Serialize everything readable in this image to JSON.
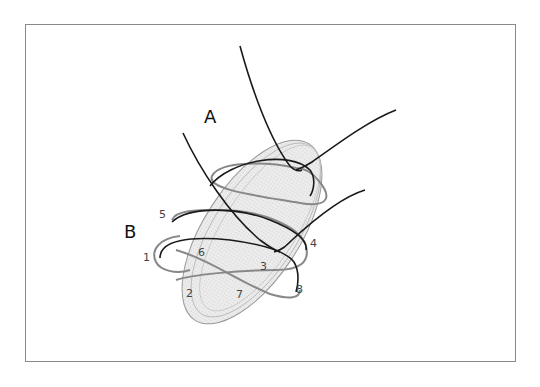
{
  "diagram": {
    "labels": {
      "A": "A",
      "B": "B"
    },
    "points": [
      {
        "id": "1",
        "label": "1"
      },
      {
        "id": "2",
        "label": "2"
      },
      {
        "id": "3",
        "label": "3"
      },
      {
        "id": "4",
        "label": "4"
      },
      {
        "id": "5",
        "label": "5"
      },
      {
        "id": "6",
        "label": "6"
      },
      {
        "id": "7",
        "label": "7"
      },
      {
        "id": "8",
        "label": "8"
      }
    ],
    "colors": {
      "frame": "#8a8a8a",
      "ellipse_fill": "#e6e6e6",
      "thread_dark": "#1a1a1a",
      "thread_gray": "#888888"
    }
  }
}
